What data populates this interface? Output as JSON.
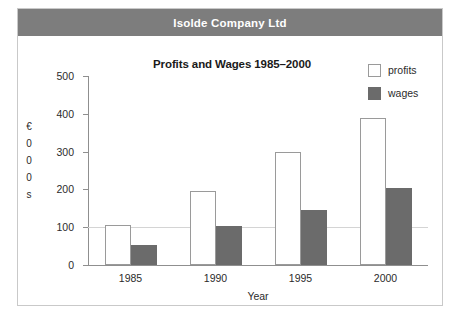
{
  "header": {
    "title": "Isolde Company Ltd"
  },
  "legend": {
    "items": [
      {
        "label": "profits",
        "swatch": "legend-swatch-profits",
        "color": "#ffffff"
      },
      {
        "label": "wages",
        "swatch": "legend-swatch-wages",
        "color": "#6b6b6b"
      }
    ]
  },
  "y_unit_label": {
    "chars": [
      "€",
      "0",
      "0",
      "0",
      "s"
    ],
    "text": "€000s"
  },
  "chart_data": {
    "type": "bar",
    "title": "Profits and Wages 1985–2000",
    "xlabel": "Year",
    "ylabel": "€000s",
    "categories": [
      "1985",
      "1990",
      "1995",
      "2000"
    ],
    "series": [
      {
        "name": "profits",
        "color": "#ffffff",
        "values": [
          105,
          195,
          300,
          390
        ]
      },
      {
        "name": "wages",
        "color": "#6b6b6b",
        "values": [
          52,
          103,
          145,
          205
        ]
      }
    ],
    "ylim": [
      0,
      500
    ],
    "yticks": [
      0,
      100,
      200,
      300,
      400,
      500
    ],
    "ytick_labels": [
      "0",
      "100",
      "200",
      "300",
      "400",
      "500"
    ],
    "grid": "single gridline at 100",
    "legend_position": "top-right"
  },
  "colors": {
    "header_band": "#7d7d7d",
    "wages_bar": "#6b6b6b",
    "profits_bar_outline": "#9a9a9a",
    "axis": "#8f8f8f",
    "frame": "#c9c9c9"
  }
}
